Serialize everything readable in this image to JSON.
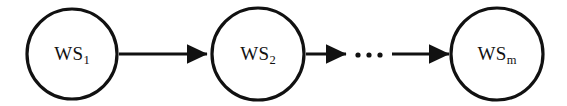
{
  "diagram": {
    "type": "flow-sequence",
    "background_color": "#ffffff",
    "stroke_color": "#111111",
    "nodes": [
      {
        "id": "ws1",
        "shape": "circle",
        "label_base": "WS",
        "label_sub": "1",
        "cx": 72,
        "cy": 54,
        "r": 45
      },
      {
        "id": "ws2",
        "shape": "circle",
        "label_base": "WS",
        "label_sub": "2",
        "cx": 258,
        "cy": 54,
        "r": 46
      },
      {
        "id": "wsm",
        "shape": "circle",
        "label_base": "WS",
        "label_sub": "m",
        "cx": 497,
        "cy": 54,
        "r": 46
      }
    ],
    "arrows": [
      {
        "id": "arrow-ws1-ws2",
        "x1": 119,
        "x2": 209,
        "y": 54
      },
      {
        "id": "arrow-ws2-ellipsis",
        "x1": 306,
        "x2": 348,
        "y": 54
      },
      {
        "id": "arrow-ellipsis-wsm",
        "x1": 392,
        "x2": 451,
        "y": 54
      }
    ],
    "ellipsis": {
      "id": "ellipsis",
      "text": "...",
      "dots": 3,
      "cx": 369,
      "cy": 55
    }
  }
}
